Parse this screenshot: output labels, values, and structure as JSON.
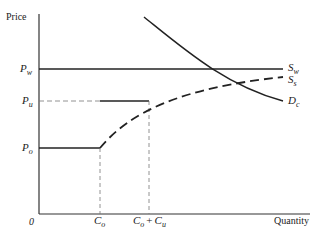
{
  "diagram": {
    "type": "supply-demand",
    "axes": {
      "y_label": "Price",
      "x_label": "Quantity",
      "origin_label": "0"
    },
    "price_levels": [
      {
        "id": "pw",
        "base": "P",
        "sub": "w"
      },
      {
        "id": "pu",
        "base": "P",
        "sub": "u"
      },
      {
        "id": "po",
        "base": "P",
        "sub": "o"
      }
    ],
    "quantity_ticks": [
      {
        "id": "co",
        "base": "C",
        "sub": "o"
      },
      {
        "id": "cocu",
        "base1": "C",
        "sub1": "o",
        "plus": "+",
        "base2": "C",
        "sub2": "u"
      }
    ],
    "curves": [
      {
        "id": "sw",
        "base": "S",
        "sub": "w",
        "style": "solid"
      },
      {
        "id": "ss",
        "base": "S",
        "sub": "s",
        "style": "dashed"
      },
      {
        "id": "dc",
        "base": "D",
        "sub": "c",
        "style": "solid"
      }
    ]
  }
}
